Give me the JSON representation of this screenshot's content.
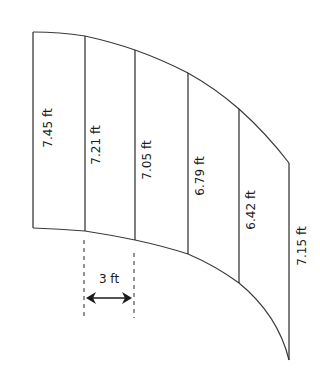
{
  "diagram": {
    "type": "curved-area-sections",
    "line_color": "#2a2a2a",
    "sections": [
      {
        "label": "7.45 ft",
        "x": 33,
        "top": 32,
        "bottom": 228,
        "label_x": 48,
        "label_y": 128
      },
      {
        "label": "7.21 ft",
        "x": 85,
        "top": 36,
        "bottom": 231,
        "label_x": 96,
        "label_y": 145
      },
      {
        "label": "7.05 ft",
        "x": 135,
        "top": 50,
        "bottom": 240,
        "label_x": 147,
        "label_y": 160
      },
      {
        "label": "6.79 ft",
        "x": 188,
        "top": 73,
        "bottom": 254,
        "label_x": 200,
        "label_y": 176
      },
      {
        "label": "6.42 ft",
        "x": 239,
        "top": 109,
        "bottom": 283,
        "label_x": 251,
        "label_y": 210
      },
      {
        "label": "7.15 ft",
        "x": 289,
        "top": 163,
        "bottom": 360,
        "label_x": 302,
        "label_y": 246
      }
    ],
    "spacing": {
      "label": "3 ft",
      "left_x": 84,
      "right_x": 134,
      "arrow_y": 298,
      "label_y": 279
    }
  }
}
